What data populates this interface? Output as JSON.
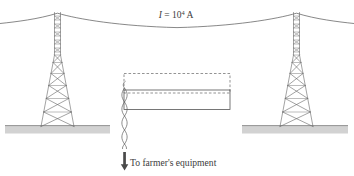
{
  "figure": {
    "background_color": "#ffffff",
    "width": 354,
    "height": 176
  },
  "labels": {
    "current": {
      "symbol": "I",
      "equals": " = ",
      "mantissa": "10",
      "exponent": "4",
      "unit": " A",
      "full_text": "I = 10⁴ A",
      "x": 176,
      "y": 18
    },
    "equipment": {
      "text": "To farmer's equipment",
      "x": 130,
      "y": 166
    }
  },
  "colors": {
    "conductor": "#555555",
    "tower": "#6a6a6a",
    "ground_fill": "#d2d2d2",
    "ground_line": "#6f6f6f",
    "box_solid": "#555555",
    "box_dashed": "#666666",
    "wire": "#5a5a5a",
    "arrow": "#4a4a4a",
    "text": "#3c3c3c"
  },
  "elements": {
    "conductor_label": "overhead transmission conductor",
    "left_tower_label": "left lattice transmission tower",
    "right_tower_label": "right lattice transmission tower",
    "left_ground_label": "left ground surface",
    "right_ground_label": "right ground surface",
    "pickup_loop_label": "solid conductor loop outline",
    "dashed_loop_label": "dashed loop area outline",
    "twisted_pair_label": "twisted pair lead wire",
    "arrow_label": "downward direction arrow"
  },
  "geometry": {
    "conductor_path": "M 0,23.5 C 16,21.8 38,19.0 57.5,13.0 C 78,19.0 120,26.0 177,27.4 C 234,26.0 276,19.0 296.5,13.0 C 316,19.0 338,21.8 354,23.5",
    "left_tower": {
      "apex_x": 57.5,
      "top_y": 12.0,
      "base_y": 126.5,
      "base_half_width": 16.5,
      "mast_half_width": 3.0,
      "mast_bottom_y": 55.0
    },
    "right_tower": {
      "apex_x": 296.5,
      "top_y": 12.0,
      "base_y": 126.5,
      "base_half_width": 16.5,
      "mast_half_width": 3.0,
      "mast_bottom_y": 55.0
    },
    "left_ground": {
      "x": 5,
      "y": 125.5,
      "width": 105,
      "height": 8
    },
    "right_ground": {
      "x": 242,
      "y": 125.5,
      "width": 106,
      "height": 8
    },
    "solid_box": {
      "x": 124,
      "y": 90,
      "width": 106,
      "height": 19.5
    },
    "dashed_box": {
      "x": 124,
      "y": 73.5,
      "width": 106,
      "height": 19.5
    },
    "twisted_pair": {
      "x": 124.5,
      "top_y": 88,
      "bottom_y": 148,
      "amplitude": 3.4,
      "period": 12
    },
    "arrow": {
      "x": 124.5,
      "top_y": 152,
      "bottom_y": 170,
      "head_width": 5.2,
      "head_height": 6.2
    }
  }
}
